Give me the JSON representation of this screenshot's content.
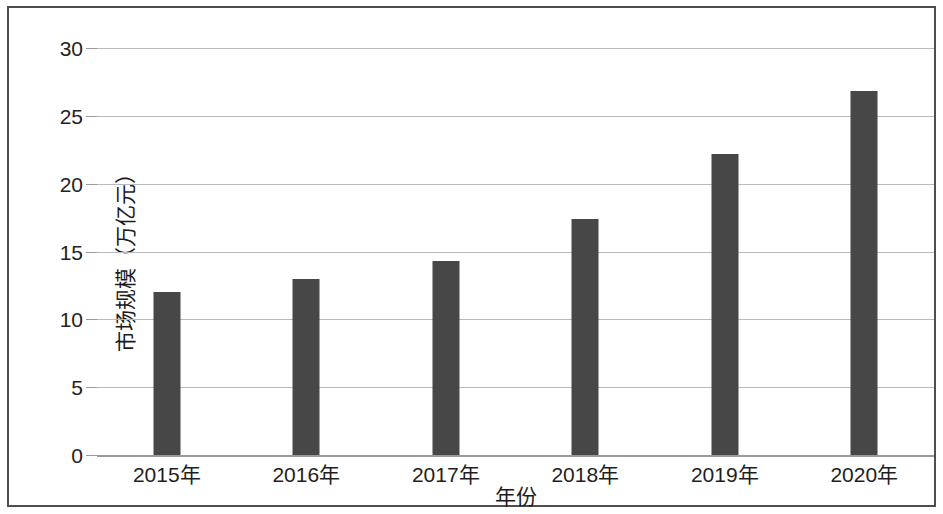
{
  "chart_data": {
    "type": "bar",
    "title": "",
    "xlabel": "年份",
    "ylabel": "市场规模（万亿元）",
    "categories": [
      "2015年",
      "2016年",
      "2017年",
      "2018年",
      "2019年",
      "2020年"
    ],
    "values": [
      12.0,
      13.0,
      14.3,
      17.4,
      22.2,
      26.8
    ],
    "ylim": [
      0,
      30
    ],
    "ytick_labels": [
      "0",
      "5",
      "10",
      "15",
      "20",
      "25",
      "30"
    ],
    "ytick_values": [
      0,
      5,
      10,
      15,
      20,
      25,
      30
    ],
    "grid": true,
    "legend": false,
    "bar_color": "#474747",
    "gridline_color": "#b9b9b9",
    "axis_color": "#9a9a9a",
    "frame_color": "#4e4e4e",
    "series": [
      {
        "name": "市场规模（万亿元）",
        "values": [
          12.0,
          13.0,
          14.3,
          17.4,
          22.2,
          26.8
        ]
      }
    ]
  }
}
